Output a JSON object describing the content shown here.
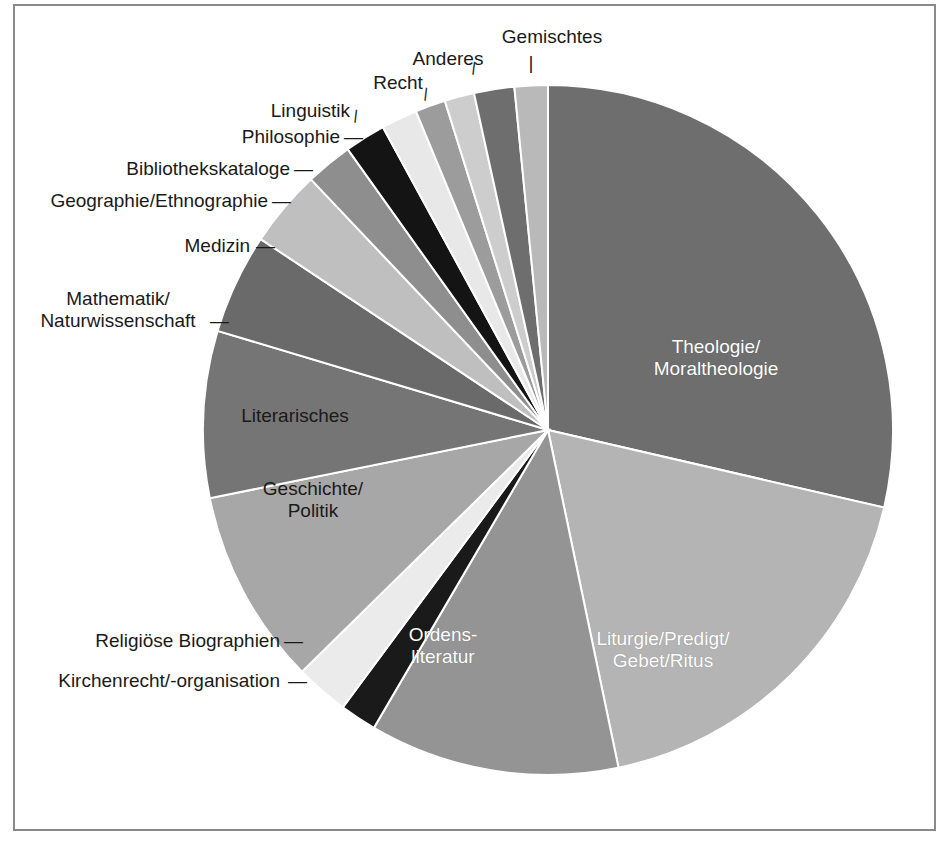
{
  "figure": {
    "border_color": "#8a8a8a",
    "background": "#ffffff"
  },
  "chart_data": {
    "type": "pie",
    "title": "",
    "subtitle": "",
    "xlabel": "",
    "ylabel": "",
    "legend_position": "none",
    "grid": false,
    "start_angle_deg": 0,
    "direction": "clockwise",
    "units": "percent",
    "categories": [
      "Theologie/\nMoraltheologie",
      "Liturgie/Predigt/\nGebet/Ritus",
      "Ordens-\nliteratur",
      "Kirchenrecht/-organisation",
      "Religiöse Biographien",
      "Geschichte/\nPolitik",
      "Literarisches",
      "Mathematik/\nNaturwissenschaft",
      "Medizin",
      "Geographie/Ethnographie",
      "Bibliothekskataloge",
      "Philosophie",
      "Linguistik",
      "Recht",
      "Anderes",
      "Gemischtes"
    ],
    "values": [
      28.6,
      18.1,
      11.7,
      1.7,
      2.5,
      9.2,
      7.8,
      4.7,
      3.6,
      2.2,
      1.9,
      1.7,
      1.4,
      1.4,
      1.9,
      1.6
    ],
    "colors": [
      "#6e6e6e",
      "#b4b4b4",
      "#949494",
      "#1a1a1a",
      "#ebebeb",
      "#a7a7a7",
      "#757575",
      "#6a6a6a",
      "#bfbfbf",
      "#8e8e8e",
      "#141414",
      "#e8e8e8",
      "#9c9c9c",
      "#cdcdcd",
      "#6e6e6e",
      "#b9b9b9"
    ],
    "slice_angles_deg": [
      {
        "start": 0,
        "end": 103.0
      },
      {
        "start": 103.0,
        "end": 168.2
      },
      {
        "start": 168.2,
        "end": 210.3
      },
      {
        "start": 210.3,
        "end": 216.5
      },
      {
        "start": 216.5,
        "end": 225.5
      },
      {
        "start": 225.5,
        "end": 258.6
      },
      {
        "start": 258.6,
        "end": 286.7
      },
      {
        "start": 286.7,
        "end": 303.6
      },
      {
        "start": 303.6,
        "end": 316.6
      },
      {
        "start": 316.6,
        "end": 324.5
      },
      {
        "start": 324.5,
        "end": 331.4
      },
      {
        "start": 331.4,
        "end": 337.5
      },
      {
        "start": 337.5,
        "end": 342.6
      },
      {
        "start": 342.6,
        "end": 347.6
      },
      {
        "start": 347.6,
        "end": 354.4
      },
      {
        "start": 354.4,
        "end": 360.0
      }
    ]
  },
  "labels": {
    "inside": [
      {
        "key": "theologie",
        "text": "Theologie/\nMoraltheologie"
      },
      {
        "key": "liturgie",
        "text": "Liturgie/Predigt/\nGebet/Ritus"
      },
      {
        "key": "ordensliteratur",
        "text": "Ordens-\nliteratur"
      },
      {
        "key": "geschichte",
        "text": "Geschichte/\nPolitik"
      },
      {
        "key": "literarisches",
        "text": "Literarisches"
      }
    ],
    "outside": [
      {
        "key": "gemischtes",
        "text": "Gemischtes"
      },
      {
        "key": "anderes",
        "text": "Anderes"
      },
      {
        "key": "recht",
        "text": "Recht"
      },
      {
        "key": "linguistik",
        "text": "Linguistik"
      },
      {
        "key": "philosophie",
        "text": "Philosophie"
      },
      {
        "key": "bibliothekskataloge",
        "text": "Bibliothekskataloge"
      },
      {
        "key": "geographie",
        "text": "Geographie/Ethnographie"
      },
      {
        "key": "medizin",
        "text": "Medizin"
      },
      {
        "key": "mathematik",
        "text": "Mathematik/\nNaturwissenschaft"
      },
      {
        "key": "religioese",
        "text": "Religiöse Biographien"
      },
      {
        "key": "kirchenrecht",
        "text": "Kirchenrecht/-organisation"
      }
    ],
    "leader_dash": "—",
    "leader_bar": "|"
  },
  "geometry": {
    "center_x": 548,
    "center_y": 430,
    "radius": 345
  }
}
